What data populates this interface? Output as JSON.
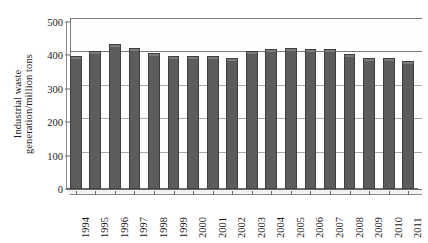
{
  "chart_data": {
    "type": "bar",
    "title": "",
    "xlabel": "",
    "ylabel": "Industrial waste generation/million tons",
    "ylabel_lines": [
      "Industrial waste",
      "generation/million tons"
    ],
    "categories": [
      "1994",
      "1995",
      "1996",
      "1997",
      "1998",
      "1999",
      "2000",
      "2001",
      "2002",
      "2003",
      "2004",
      "2005",
      "2006",
      "2007",
      "2008",
      "2009",
      "2010",
      "2011"
    ],
    "values": [
      395,
      410,
      430,
      420,
      405,
      395,
      395,
      395,
      390,
      410,
      415,
      420,
      415,
      415,
      400,
      390,
      390,
      380
    ],
    "ylim": [
      0,
      500
    ],
    "yticks": [
      0,
      100,
      200,
      300,
      400,
      500
    ],
    "ytick_labels": [
      "0",
      "100",
      "200",
      "300",
      "400",
      "500"
    ],
    "grid": true,
    "legend": null,
    "series_color": "#5c5c5c",
    "axis_color": "#6a6a6a",
    "grid_color": "#a9a9a9",
    "background": "#ffffff"
  }
}
